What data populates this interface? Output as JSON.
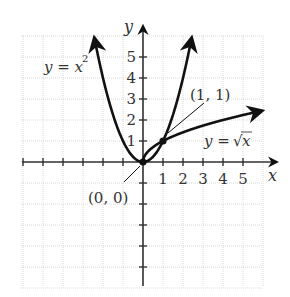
{
  "chart_data": {
    "type": "line",
    "title": "",
    "xlabel": "x",
    "ylabel": "y",
    "xlim": [
      -6,
      6
    ],
    "ylim": [
      -6,
      6
    ],
    "grid": true,
    "x_ticks": [
      "1",
      "2",
      "3",
      "4",
      "5"
    ],
    "y_ticks": [
      "1",
      "2",
      "3",
      "4",
      "5"
    ],
    "series": [
      {
        "name": "y = x²",
        "function": "x^2",
        "x": [
          -2.4,
          -2,
          -1,
          0,
          1,
          2,
          2.4
        ],
        "y": [
          5.76,
          4,
          1,
          0,
          1,
          4,
          5.76
        ]
      },
      {
        "name": "y = √x",
        "function": "sqrt(x)",
        "x": [
          0,
          1,
          2,
          3,
          4,
          5,
          5.95
        ],
        "y": [
          0,
          1,
          1.41,
          1.73,
          2,
          2.24,
          2.44
        ]
      }
    ],
    "annotations": [
      {
        "text": "(0, 0)",
        "x": 0,
        "y": 0
      },
      {
        "text": "(1, 1)",
        "x": 1,
        "y": 1
      }
    ],
    "labels": {
      "parabola": "y = x",
      "parabola_exp": "2",
      "sqrt_prefix": "y = ",
      "sqrt_symbol": "√",
      "sqrt_arg": "x"
    }
  },
  "colors": {
    "curve": "#111111",
    "axis": "#333333",
    "grid": "#d8d8d8",
    "text": "#333333"
  }
}
